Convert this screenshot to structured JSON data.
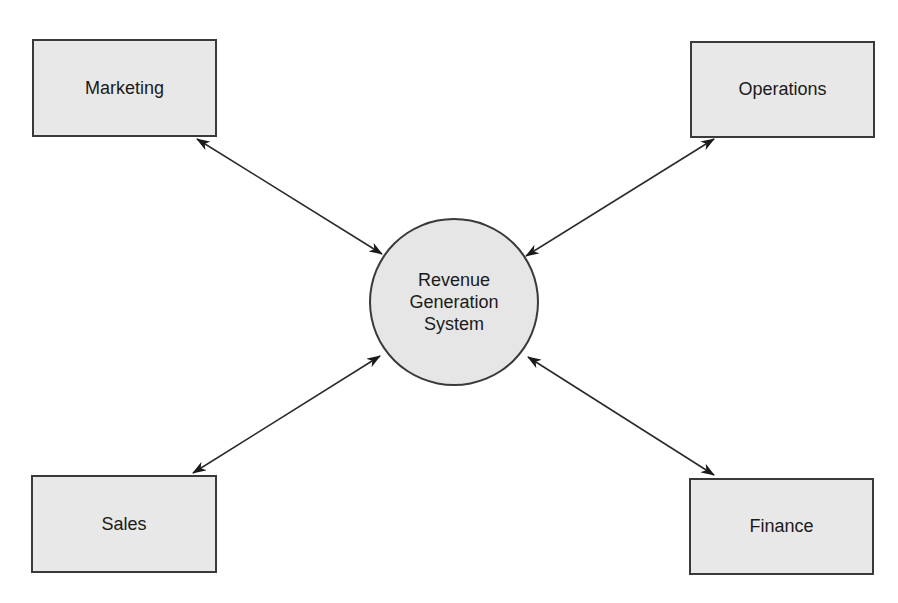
{
  "diagram": {
    "type": "hub-and-spoke",
    "center": {
      "label_lines": [
        "Revenue",
        "Generation",
        "System"
      ]
    },
    "nodes": {
      "marketing": {
        "label": "Marketing"
      },
      "operations": {
        "label": "Operations"
      },
      "sales": {
        "label": "Sales"
      },
      "finance": {
        "label": "Finance"
      }
    },
    "edges": [
      {
        "from": "Marketing",
        "to": "Revenue Generation System",
        "direction": "bidirectional"
      },
      {
        "from": "Operations",
        "to": "Revenue Generation System",
        "direction": "bidirectional"
      },
      {
        "from": "Sales",
        "to": "Revenue Generation System",
        "direction": "bidirectional"
      },
      {
        "from": "Finance",
        "to": "Revenue Generation System",
        "direction": "bidirectional"
      }
    ],
    "colors": {
      "box_fill": "#e8e8e8",
      "circle_fill": "#e6e6e6",
      "stroke": "#3a3a3a",
      "arrow": "#1a1a1a"
    }
  }
}
